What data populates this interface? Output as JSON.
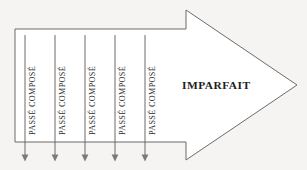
{
  "diagram": {
    "type": "arrow-timeline",
    "background_color": "#f5f4f2",
    "stroke_color": "#6b6b6b",
    "text_color": "#2e2e2e",
    "arrow": {
      "name": "imparfait-arrow",
      "label": "IMPARFAIT",
      "label_x": 182,
      "label_y": 81,
      "body": {
        "x": 15,
        "y": 29,
        "width": 171,
        "height": 113
      },
      "head": {
        "base_x": 186,
        "top_y": 10,
        "bottom_y": 160,
        "tip_x": 297,
        "tip_y": 85
      }
    },
    "events": [
      {
        "label": "PASSÉ COMPOSÉ",
        "x": 25,
        "line_top": 35,
        "line_bottom": 161,
        "text_x": 29,
        "text_y": 135
      },
      {
        "label": "PASSÉ COMPOSÉ",
        "x": 55,
        "line_top": 35,
        "line_bottom": 161,
        "text_x": 59,
        "text_y": 135
      },
      {
        "label": "PASSÉ COMPOSÉ",
        "x": 85,
        "line_top": 35,
        "line_bottom": 161,
        "text_x": 89,
        "text_y": 135
      },
      {
        "label": "PASSÉ COMPOSÉ",
        "x": 115,
        "line_top": 35,
        "line_bottom": 161,
        "text_x": 119,
        "text_y": 135
      },
      {
        "label": "PASSÉ COMPOSÉ",
        "x": 145,
        "line_top": 35,
        "line_bottom": 161,
        "text_x": 149,
        "text_y": 135
      }
    ]
  }
}
